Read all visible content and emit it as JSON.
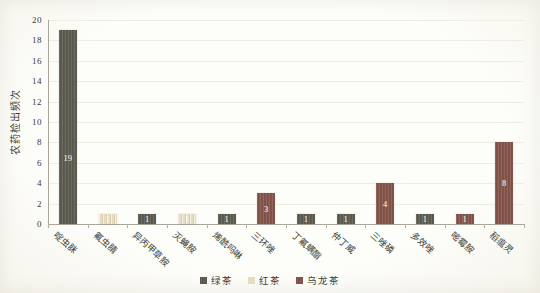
{
  "figure": {
    "paper_background": "#fbfaf5",
    "plot_background": "#fdfdfa",
    "axis_color": "#aaa69b",
    "gridline_color": "#efece1",
    "text_color": "#3c3a33"
  },
  "chart_data": {
    "type": "bar",
    "title": "",
    "xlabel": "",
    "ylabel": "农药检出频次",
    "ylim": [
      0,
      20
    ],
    "ytick_step": 2,
    "grid": "horizontal-faint",
    "legend_position": "bottom",
    "value_label_color": "#ffffff",
    "series": [
      {
        "name": "绿茶",
        "color": "#5e5b50"
      },
      {
        "name": "红茶",
        "color": "#e6dcc2"
      },
      {
        "name": "乌龙茶",
        "color": "#84544a"
      }
    ],
    "categories": [
      "啶虫脒",
      "氟虫腈",
      "异丙甲草胺",
      "灭蝇胺",
      "烯酰吗啉",
      "三环唑",
      "丁氟螨酯",
      "仲丁威",
      "三唑磷",
      "多效唑",
      "嘧霉胺",
      "稻瘟灵"
    ],
    "bars": [
      {
        "category": "啶虫脒",
        "series": "绿茶",
        "value": 19
      },
      {
        "category": "氟虫腈",
        "series": "红茶",
        "value": 1
      },
      {
        "category": "异丙甲草胺",
        "series": "绿茶",
        "value": 1
      },
      {
        "category": "灭蝇胺",
        "series": "红茶",
        "value": 1
      },
      {
        "category": "烯酰吗啉",
        "series": "绿茶",
        "value": 1
      },
      {
        "category": "三环唑",
        "series": "乌龙茶",
        "value": 3
      },
      {
        "category": "丁氟螨酯",
        "series": "绿茶",
        "value": 1
      },
      {
        "category": "仲丁威",
        "series": "绿茶",
        "value": 1
      },
      {
        "category": "三唑磷",
        "series": "乌龙茶",
        "value": 4
      },
      {
        "category": "多效唑",
        "series": "绿茶",
        "value": 1
      },
      {
        "category": "嘧霉胺",
        "series": "乌龙茶",
        "value": 1
      },
      {
        "category": "稻瘟灵",
        "series": "乌龙茶",
        "value": 8
      }
    ]
  }
}
